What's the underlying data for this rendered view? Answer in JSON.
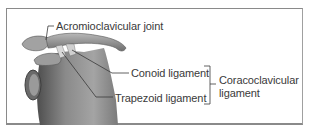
{
  "figure": {
    "labels": {
      "acromioclavicular_joint": "Acromioclavicular joint",
      "conoid_ligament": "Conoid ligament",
      "trapezoid_ligament": "Trapezoid ligament",
      "coracoclavicular_ligament_line1": "Coracoclavicular",
      "coracoclavicular_ligament_line2": "ligament"
    },
    "colors": {
      "bone": "#8c8c8c",
      "bone_dark": "#5a5a5a",
      "leader_line": "#3a3a3a",
      "frame": "#8a8a8a"
    }
  }
}
